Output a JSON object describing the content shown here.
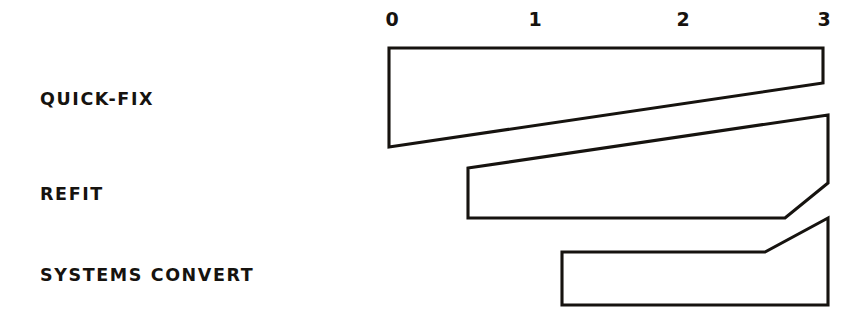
{
  "figure": {
    "background_color": "#ffffff",
    "ink_color": "#16130f",
    "style": "hand-drawn-sketch"
  },
  "axis": {
    "name": "top-time-axis",
    "ticks": [
      {
        "label": "0",
        "value": 0,
        "x": 389
      },
      {
        "label": "1",
        "value": 1,
        "x": 534
      },
      {
        "label": "2",
        "value": 2,
        "x": 679
      },
      {
        "label": "3",
        "value": 3,
        "x": 824
      }
    ],
    "range": [
      0,
      3
    ],
    "position": "top",
    "grid": false
  },
  "rows": [
    {
      "label": "QUICK-FIX",
      "label_x": 40,
      "label_y": 105
    },
    {
      "label": "REFIT",
      "label_x": 40,
      "label_y": 200
    },
    {
      "label": "SYSTEMS CONVERT",
      "label_x": 40,
      "label_y": 281
    }
  ],
  "bars": [
    {
      "name": "quick-fix-bar",
      "row": "QUICK-FIX",
      "start": 0,
      "end": 3,
      "points": "389,48 823,48 823,83 389,147"
    },
    {
      "name": "refit-bar",
      "row": "REFIT",
      "start": 0.55,
      "end": 3,
      "points": "468,168 828,115 828,183 785,218 468,218"
    },
    {
      "name": "systems-convert-bar",
      "row": "SYSTEMS CONVERT",
      "start": 1.2,
      "end": 3,
      "points": "562,252 765,252 828,218 828,305 562,305"
    }
  ],
  "chart_data": {
    "type": "bar",
    "title": "",
    "subtitle": "",
    "xlabel": "",
    "ylabel": "",
    "orientation": "horizontal",
    "style": "hand-drawn tapered gantt / timeline bars",
    "categories": [
      "QUICK-FIX",
      "REFIT",
      "SYSTEMS CONVERT"
    ],
    "x_tick_labels": [
      "0",
      "1",
      "2",
      "3"
    ],
    "x_tick_values": [
      0,
      1,
      2,
      3
    ],
    "xlim": [
      0,
      3
    ],
    "axis_position": "top",
    "grid": false,
    "legend": null,
    "series": [
      {
        "name": "duration",
        "values": [
          3.0,
          2.45,
          1.8
        ]
      }
    ],
    "bars": [
      {
        "category": "QUICK-FIX",
        "start": 0.0,
        "end": 3.0,
        "duration": 3.0,
        "shape": "wedge",
        "thickness_start": 0.99,
        "thickness_end": 0.35,
        "note": "full-width wedge tapering from thick at 0 to thin at 3"
      },
      {
        "category": "REFIT",
        "start": 0.55,
        "end": 3.0,
        "duration": 2.45,
        "shape": "wedge-with-bevel",
        "thickness_start": 0.5,
        "thickness_end": 0.68,
        "note": "starts at ~0.55, top edge rises to the right, bevelled lower-right corner"
      },
      {
        "category": "SYSTEMS CONVERT",
        "start": 1.2,
        "end": 3.0,
        "duration": 1.8,
        "shape": "rect-with-ramp",
        "thickness_start": 0.53,
        "thickness_end": 0.87,
        "note": "rectangle with top edge ramping upward after ~2.6"
      }
    ]
  }
}
